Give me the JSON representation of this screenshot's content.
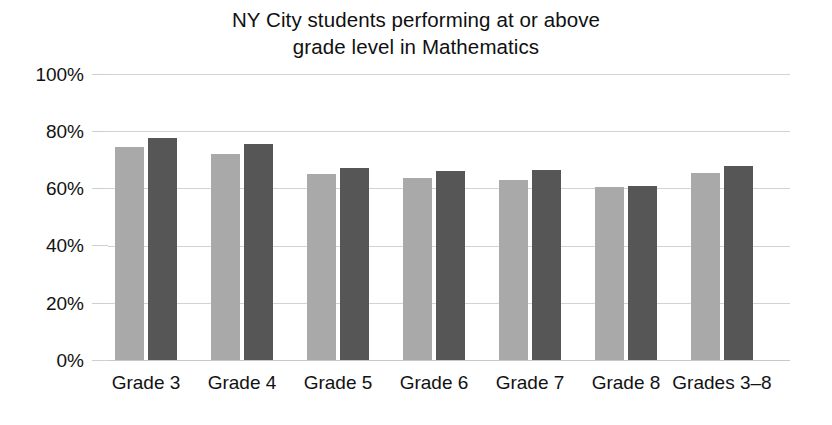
{
  "chart_data": {
    "type": "bar",
    "title": "NY City students performing at or above grade level in Mathematics",
    "title_lines": [
      "NY City students performing at or above",
      "grade level in Mathematics"
    ],
    "xlabel": "",
    "ylabel": "",
    "ylim": [
      0,
      100
    ],
    "ytick_labels": [
      "0%",
      "20%",
      "40%",
      "60%",
      "80%",
      "100%"
    ],
    "ytick_values": [
      0,
      20,
      40,
      60,
      80,
      100
    ],
    "grid": true,
    "grid_axis": "y",
    "legend": "none",
    "categories": [
      "Grade 3",
      "Grade 4",
      "Grade 5",
      "Grade 6",
      "Grade 7",
      "Grade 8",
      "Grades 3–8"
    ],
    "series": [
      {
        "name": "series-1",
        "color": "#a9a9a9",
        "values": [
          74.5,
          72.0,
          65.0,
          63.5,
          63.0,
          60.5,
          65.5
        ]
      },
      {
        "name": "series-2",
        "color": "#565656",
        "values": [
          77.5,
          75.5,
          67.0,
          66.0,
          66.5,
          61.0,
          68.0
        ]
      }
    ]
  },
  "colors": {
    "series_light": "#a9a9a9",
    "series_dark": "#565656",
    "gridline": "#d2d2d2",
    "text": "#121212",
    "background": "#ffffff"
  }
}
